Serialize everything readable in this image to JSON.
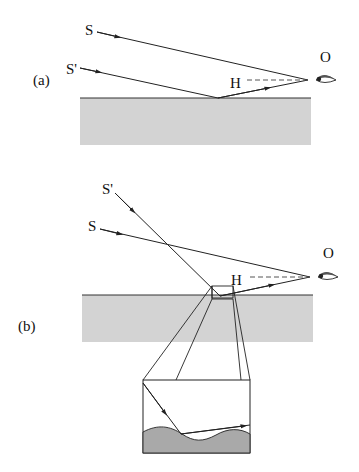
{
  "figure": {
    "panel_a": {
      "label": "(a)",
      "source_label": "S",
      "image_source_label": "S'",
      "horizon_label": "H",
      "observer_label": "O"
    },
    "panel_b": {
      "label": "(b)",
      "source_label": "S",
      "image_source_label": "S'",
      "horizon_label": "H",
      "observer_label": "O"
    },
    "colors": {
      "ground_fill": "#d3d3d3",
      "wavy_surface_fill": "#a9a9a9",
      "line": "#222222",
      "background": "#ffffff"
    }
  }
}
